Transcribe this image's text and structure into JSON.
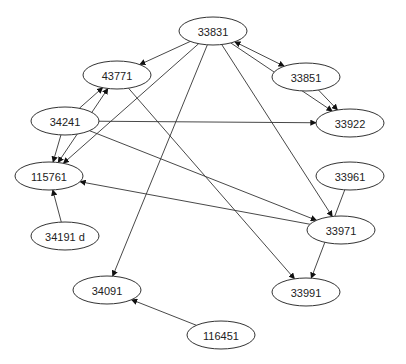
{
  "diagram": {
    "type": "directed-graph",
    "nodes": [
      {
        "id": "33831",
        "label": "33831",
        "cx": 213,
        "cy": 31,
        "rx": 34,
        "ry": 14
      },
      {
        "id": "43771",
        "label": "43771",
        "cx": 117,
        "cy": 75,
        "rx": 34,
        "ry": 14
      },
      {
        "id": "33851",
        "label": "33851",
        "cx": 306,
        "cy": 77,
        "rx": 34,
        "ry": 14
      },
      {
        "id": "34241",
        "label": "34241",
        "cx": 65,
        "cy": 121,
        "rx": 34,
        "ry": 14
      },
      {
        "id": "33922",
        "label": "33922",
        "cx": 350,
        "cy": 123,
        "rx": 34,
        "ry": 14
      },
      {
        "id": "115761",
        "label": "115761",
        "cx": 49,
        "cy": 176,
        "rx": 34,
        "ry": 14
      },
      {
        "id": "33961",
        "label": "33961",
        "cx": 350,
        "cy": 176,
        "rx": 34,
        "ry": 14
      },
      {
        "id": "34191d",
        "label": "34191 d",
        "cx": 65,
        "cy": 236,
        "rx": 34,
        "ry": 14
      },
      {
        "id": "33971",
        "label": "33971",
        "cx": 341,
        "cy": 230,
        "rx": 34,
        "ry": 14
      },
      {
        "id": "34091",
        "label": "34091",
        "cx": 107,
        "cy": 290,
        "rx": 34,
        "ry": 14
      },
      {
        "id": "33991",
        "label": "33991",
        "cx": 306,
        "cy": 292,
        "rx": 34,
        "ry": 14
      },
      {
        "id": "116451",
        "label": "116451",
        "cx": 221,
        "cy": 335,
        "rx": 34,
        "ry": 14
      }
    ],
    "edges": [
      {
        "from": "33831",
        "to": "43771",
        "bidirectional": false
      },
      {
        "from": "33831",
        "to": "33851",
        "bidirectional": true
      },
      {
        "from": "33831",
        "to": "115761",
        "bidirectional": false
      },
      {
        "from": "33831",
        "to": "33922",
        "bidirectional": false
      },
      {
        "from": "33831",
        "to": "33971",
        "bidirectional": false
      },
      {
        "from": "33831",
        "to": "34091",
        "bidirectional": false
      },
      {
        "from": "33851",
        "to": "33922",
        "bidirectional": false
      },
      {
        "from": "43771",
        "to": "115761",
        "bidirectional": true
      },
      {
        "from": "43771",
        "to": "33991",
        "bidirectional": false
      },
      {
        "from": "34241",
        "to": "43771",
        "bidirectional": false
      },
      {
        "from": "34241",
        "to": "115761",
        "bidirectional": false
      },
      {
        "from": "34241",
        "to": "33922",
        "bidirectional": false
      },
      {
        "from": "34241",
        "to": "33971",
        "bidirectional": false
      },
      {
        "from": "34191d",
        "to": "115761",
        "bidirectional": false
      },
      {
        "from": "33971",
        "to": "115761",
        "bidirectional": false
      },
      {
        "from": "33961",
        "to": "33991",
        "bidirectional": false
      },
      {
        "from": "116451",
        "to": "34091",
        "bidirectional": false
      }
    ],
    "colors": {
      "stroke": "#333333",
      "fill": "#ffffff",
      "text": "#222222",
      "background": "#ffffff"
    }
  }
}
